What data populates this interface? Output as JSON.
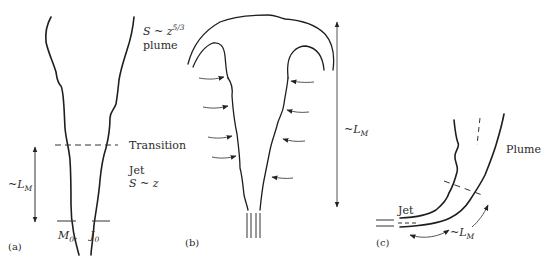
{
  "figure": {
    "panel_a": {
      "label": "(a)",
      "plume_scaling_prefix": "S ~ z",
      "plume_scaling_exponent": "5/3",
      "plume_label": "plume",
      "transition_label": "Transition",
      "jet_label": "Jet",
      "jet_scaling": "S ~ z",
      "length_label_prefix": "~L",
      "length_label_subscript": "M",
      "source_M_label": "M",
      "source_M_subscript": "0",
      "source_separator": ",",
      "source_J_label": "J",
      "source_J_subscript": "0"
    },
    "panel_b": {
      "label": "(b)",
      "length_label_prefix": "~L",
      "length_label_subscript": "M",
      "entrainment_arrows_left": 4,
      "entrainment_arrows_right": 4
    },
    "panel_c": {
      "label": "(c)",
      "jet_label": "Jet",
      "plume_label": "Plume",
      "length_label_prefix": "~L",
      "length_label_subscript": "M"
    }
  }
}
